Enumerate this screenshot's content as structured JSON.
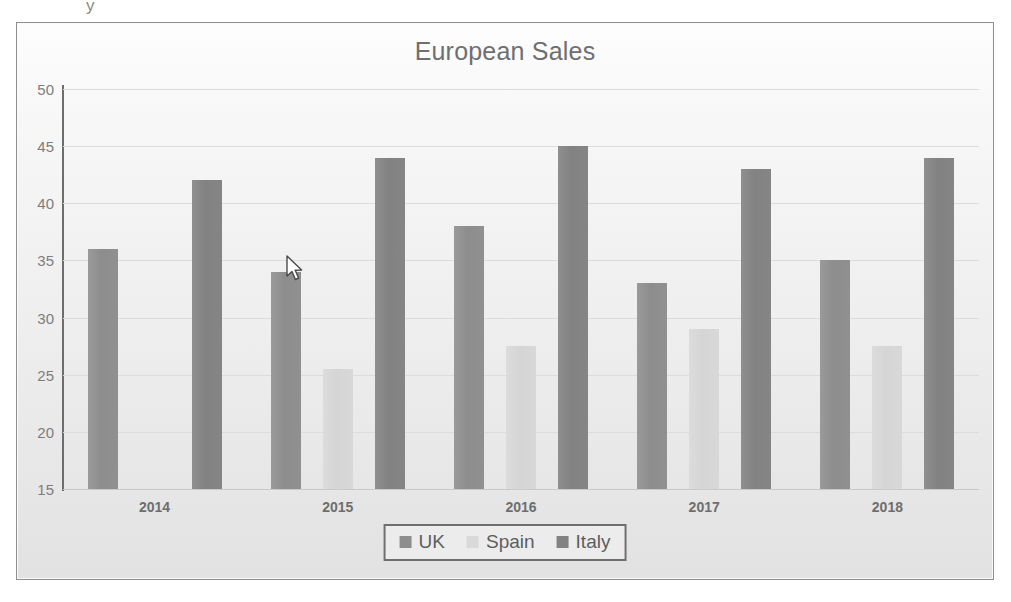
{
  "chart_data": {
    "type": "bar",
    "title": "European Sales",
    "xlabel": "",
    "ylabel": "",
    "categories": [
      "2014",
      "2015",
      "2016",
      "2017",
      "2018"
    ],
    "series": [
      {
        "name": "UK",
        "color": "#8d8d8d",
        "values": [
          36,
          34,
          38,
          33,
          35
        ]
      },
      {
        "name": "Spain",
        "color": "#d9d9d9",
        "values": [
          15,
          25.5,
          27.5,
          29,
          27.5
        ]
      },
      {
        "name": "Italy",
        "color": "#828282",
        "values": [
          42,
          44,
          45,
          43,
          44
        ]
      }
    ],
    "ylim": [
      15,
      50
    ],
    "yticks": [
      15,
      20,
      25,
      30,
      35,
      40,
      45,
      50
    ],
    "ytick_labels": [
      "15",
      "20",
      "25",
      "30",
      "35",
      "40",
      "45",
      "50"
    ],
    "grid": true,
    "legend_position": "bottom"
  },
  "legend": {
    "items": [
      {
        "label": "UK"
      },
      {
        "label": "Spain"
      },
      {
        "label": "Italy"
      }
    ]
  },
  "cursor": {
    "icon": "arrow-pointer",
    "x": 268,
    "y": 232
  },
  "artifact": {
    "mark": "y"
  }
}
